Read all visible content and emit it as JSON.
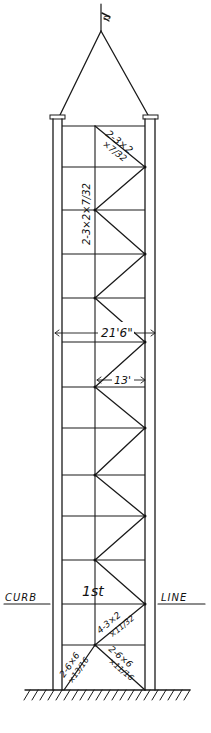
{
  "drawing": {
    "title": "Tower elevation",
    "flag_mark": "Ŋ",
    "dimensions": {
      "overall_width": "21'6\"",
      "inner_width": "13'"
    },
    "member_labels": {
      "top_diagonal": "2-3×2",
      "top_diagonal_thickness": "×7/32",
      "column_strut": "2-3×2×7/32",
      "lower_diagonal": "4-3×2",
      "lower_diagonal_thickness": "×11/32",
      "base_left": "2-6×6",
      "base_left_thickness": "×13/16",
      "base_right": "2-6×6",
      "base_right_thickness": "×11/16"
    },
    "level_label": "1st",
    "curb_label_left": "CURB",
    "curb_label_right": "LINE"
  }
}
